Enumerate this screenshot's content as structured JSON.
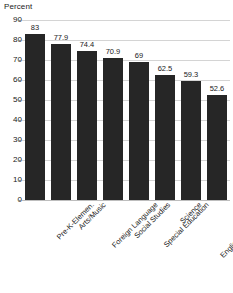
{
  "chart_data": {
    "type": "bar",
    "title": "",
    "subtitle": "",
    "xlabel": "",
    "ylabel": "Percent",
    "ylim": [
      0,
      90
    ],
    "ytick_step": 10,
    "yticks": [
      0,
      10,
      20,
      30,
      40,
      50,
      60,
      70,
      80,
      90
    ],
    "grid": true,
    "legend": false,
    "legend_position": "none",
    "value_labels_shown": true,
    "categories": [
      "Pre-K-Elemen.",
      "Arts/Music",
      "Foreign Language",
      "Social Studies",
      "Special Education",
      "Science",
      "English/Language Arts",
      "Mathematics"
    ],
    "values": [
      83,
      77.9,
      74.4,
      70.9,
      69,
      62.5,
      59.3,
      52.6
    ],
    "value_labels": [
      "83",
      "77.9",
      "74.4",
      "70.9",
      "69",
      "62.5",
      "59.3",
      "52.6"
    ],
    "bar_color": "#262626",
    "gridline_color": "#d4d4d4",
    "background_color": "#ffffff",
    "text_color": "#1a1a1a"
  }
}
